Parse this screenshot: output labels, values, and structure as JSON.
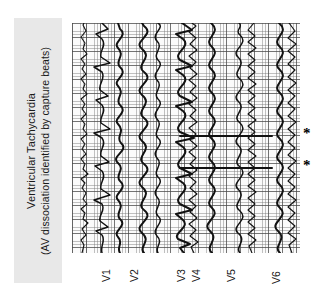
{
  "figure": {
    "type": "ecg-strip",
    "orientation": "rotated-90-ccw",
    "background_color": "#ffffff"
  },
  "caption": {
    "banner_color": "#e8e8e8",
    "line1": "Ventricular Tachycardia",
    "line2": "(AV dissociation identified by capture beats)"
  },
  "ecg": {
    "paper_color": "#fbfbfb",
    "grid_fine_color": "#787878",
    "grid_bold_color": "#464646",
    "trace_color": "#111111",
    "leads": [
      {
        "label": "V1"
      },
      {
        "label": "V2"
      },
      {
        "label": "V3"
      },
      {
        "label": "V4"
      },
      {
        "label": "V5"
      },
      {
        "label": "V6"
      }
    ]
  },
  "annotations": {
    "capture_beat_marker": "*",
    "markers": [
      {
        "symbol": "*",
        "meaning": "capture-beat"
      },
      {
        "symbol": "*",
        "meaning": "capture-beat"
      }
    ]
  }
}
